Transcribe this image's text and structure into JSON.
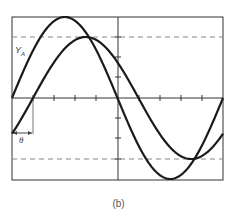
{
  "figure": {
    "caption": "(b)",
    "curve_label": "Y",
    "curve_label_sub": "A",
    "phase_label": "θ",
    "colors": {
      "curve": "#1a1a1a",
      "frame": "#333333",
      "dash": "#888888",
      "background": "#ffffff"
    }
  },
  "frame": {
    "x0": 12,
    "y0": 17,
    "x1": 223,
    "y1": 180,
    "axis_y": 98,
    "center_x": 118
  },
  "grid": {
    "h_ticks_x": [
      33,
      54,
      75,
      96,
      139,
      160,
      181,
      202
    ],
    "v_ticks_y": [
      37,
      57,
      77,
      118,
      138,
      159
    ],
    "dashed_y": [
      37,
      159
    ]
  },
  "phase_marker": {
    "x": 33,
    "y_top": 98,
    "y_bottom": 134,
    "arrow_y": 133
  },
  "chart_data": {
    "type": "line",
    "title": "",
    "xlabel": "",
    "ylabel": "",
    "grid": false,
    "series": [
      {
        "name": "Y_A (reference, larger amplitude)",
        "amplitude": 1.0,
        "phase_deg": 0,
        "period_fraction_shown": 1.0
      },
      {
        "name": "Lagging wave (smaller amplitude)",
        "amplitude": 0.75,
        "phase_deg": -36,
        "period_fraction_shown": 1.0
      }
    ],
    "annotations": [
      "Y_A",
      "θ (phase shift)",
      "(b)"
    ]
  }
}
